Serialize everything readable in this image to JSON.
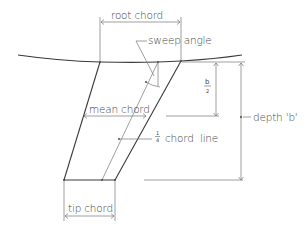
{
  "diagram": {
    "labels": {
      "root_chord": "root chord",
      "sweep_angle": "sweep angle",
      "mean_chord": "mean chord",
      "quarter_chord_fraction_num": "1",
      "quarter_chord_fraction_den": "4",
      "quarter_chord_line": "chord  line",
      "half_span_num": "b",
      "half_span_den": "2",
      "depth_b": "depth 'b'",
      "tip_chord": "tip chord"
    },
    "colors": {
      "line": "#4a4a4a",
      "text": "#444444",
      "background": "#ffffff"
    }
  }
}
